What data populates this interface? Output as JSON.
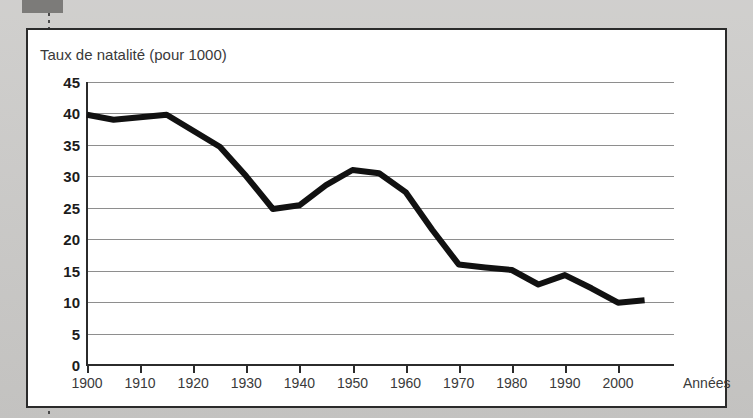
{
  "figure": {
    "title": "Taux de natalité (pour 1000)",
    "xaxis_title": "Années",
    "line_color": "#111111",
    "grid_color": "#8e8e8e",
    "axis_color": "#2b2b2b",
    "background": "#ffffff",
    "page_background": "#cbcac8",
    "tab_color": "#7c7b79"
  },
  "chart_data": {
    "type": "line",
    "title": "Taux de natalité (pour 1000)",
    "xlabel": "Années",
    "ylabel": "Taux de natalité (pour 1000)",
    "xlim": [
      1897,
      2008
    ],
    "ylim": [
      0,
      45
    ],
    "grid": true,
    "legend": null,
    "yticks": [
      0,
      5,
      10,
      15,
      20,
      25,
      30,
      35,
      40,
      45
    ],
    "ytick_labels": [
      "0",
      "5",
      "10",
      "15",
      "20",
      "25",
      "30",
      "35",
      "40",
      "45"
    ],
    "xticks": [
      1900,
      1910,
      1920,
      1930,
      1940,
      1950,
      1960,
      1970,
      1980,
      1990,
      2000
    ],
    "xtick_labels": [
      "1900",
      "1910",
      "1920",
      "1930",
      "1940",
      "1950",
      "1960",
      "1970",
      "1980",
      "1990",
      "2000"
    ],
    "series": [
      {
        "name": "Taux de natalité",
        "color": "#111111",
        "x": [
          1900,
          1905,
          1915,
          1925,
          1930,
          1935,
          1940,
          1945,
          1950,
          1955,
          1960,
          1965,
          1970,
          1975,
          1980,
          1985,
          1990,
          1995,
          2000,
          2005
        ],
        "values": [
          39.8,
          39.0,
          39.8,
          34.7,
          30.0,
          24.8,
          25.4,
          28.6,
          31.0,
          30.5,
          27.5,
          21.5,
          16.0,
          15.5,
          15.1,
          12.8,
          14.3,
          12.2,
          9.9,
          10.3
        ]
      }
    ]
  }
}
